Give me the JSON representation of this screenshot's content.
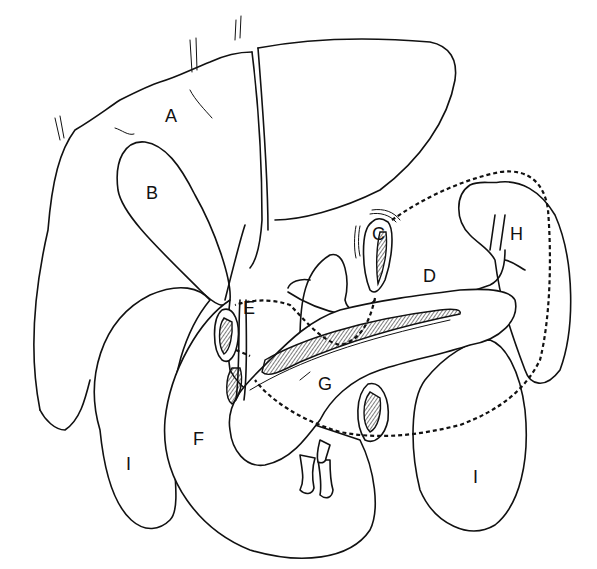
{
  "diagram": {
    "type": "anatomical line drawing",
    "colors": {
      "ink": "#111111",
      "background": "#ffffff"
    },
    "labels": [
      {
        "id": "A",
        "text": "A",
        "x": 165,
        "y": 122
      },
      {
        "id": "B",
        "text": "B",
        "x": 146,
        "y": 199
      },
      {
        "id": "C",
        "text": "C",
        "x": 372,
        "y": 240
      },
      {
        "id": "D",
        "text": "D",
        "x": 423,
        "y": 282
      },
      {
        "id": "E",
        "text": "E",
        "x": 243,
        "y": 314
      },
      {
        "id": "F",
        "text": "F",
        "x": 193,
        "y": 445
      },
      {
        "id": "G",
        "text": "G",
        "x": 318,
        "y": 390
      },
      {
        "id": "H",
        "text": "H",
        "x": 510,
        "y": 240
      },
      {
        "id": "I_left",
        "text": "I",
        "x": 126,
        "y": 470
      },
      {
        "id": "I_right",
        "text": "I",
        "x": 473,
        "y": 483
      }
    ]
  }
}
